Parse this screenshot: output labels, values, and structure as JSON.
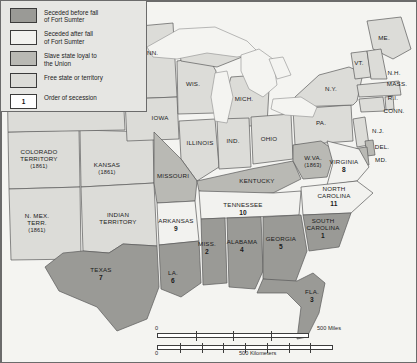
{
  "map": {
    "title": "Secession of the Southern States",
    "colors": {
      "seceded_before": "#9a9a96",
      "seceded_after": "#f2f2ef",
      "slave_loyal": "#b9b9b4",
      "free_state": "#dcdcd8",
      "water": "#f4f4f1",
      "border": "#5a5a5a",
      "background": "#e9e9e6"
    }
  },
  "legend": {
    "items": [
      {
        "label": "Seceded before fall\nof Fort Sumter",
        "line1": "Seceded before fall",
        "line2": "of Fort Sumter",
        "swatch": "#9a9a96"
      },
      {
        "label": "Seceded after fall\nof Fort Sumter",
        "line1": "Seceded after fall",
        "line2": "of Fort Sumter",
        "swatch": "#f2f2ef"
      },
      {
        "label": "Slave state loyal to\nthe Union",
        "line1": "Slave state loyal to",
        "line2": "the Union",
        "swatch": "#b9b9b4"
      },
      {
        "label": "Free state or territory",
        "line1": "Free state or territory",
        "line2": "",
        "swatch": "#dcdcd8"
      }
    ],
    "order_key": {
      "number": "1",
      "label": "Order of secession",
      "swatch": "#ffffff"
    }
  },
  "scale": {
    "miles_zero": "0",
    "miles_label": "500 Miles",
    "km_zero": "0",
    "km_label": "500 Kilometers"
  },
  "water_labels": [
    {
      "name": "ATLANTIC OCEAN",
      "x": 370,
      "y": 262
    },
    {
      "name": "GULF OF MEXICO",
      "x": 253,
      "y": 307
    }
  ],
  "lake_labels": [
    {
      "name": "Superior",
      "x": 182,
      "y": 36,
      "rot": -12
    },
    {
      "name": "L. Michigan",
      "x": 222,
      "y": 92,
      "rot": 72
    },
    {
      "name": "L. Huron",
      "x": 256,
      "y": 63,
      "rot": 38
    },
    {
      "name": "L. Erie",
      "x": 290,
      "y": 107,
      "rot": 28
    }
  ],
  "states": [
    {
      "name": "MINN.",
      "x": 148,
      "y": 52,
      "num": "",
      "year": "",
      "cat": "free"
    },
    {
      "name": "WIS.",
      "x": 192,
      "y": 83,
      "num": "",
      "year": "",
      "cat": "free"
    },
    {
      "name": "MICH.",
      "x": 243,
      "y": 98,
      "num": "",
      "year": "",
      "cat": "free"
    },
    {
      "name": "IOWA",
      "x": 159,
      "y": 117,
      "num": "",
      "year": "",
      "cat": "free"
    },
    {
      "name": "ILLINOIS",
      "x": 199,
      "y": 142,
      "num": "",
      "year": "",
      "cat": "free"
    },
    {
      "name": "IND.",
      "x": 232,
      "y": 140,
      "num": "",
      "year": "",
      "cat": "free"
    },
    {
      "name": "OHIO",
      "x": 268,
      "y": 138,
      "num": "",
      "year": "",
      "cat": "free"
    },
    {
      "name": "PA.",
      "x": 320,
      "y": 122,
      "num": "",
      "year": "",
      "cat": "free"
    },
    {
      "name": "N.Y.",
      "x": 330,
      "y": 88,
      "num": "",
      "year": "",
      "cat": "free"
    },
    {
      "name": "ME.",
      "x": 383,
      "y": 37,
      "num": "",
      "year": "",
      "cat": "free"
    },
    {
      "name": "VT.",
      "x": 358,
      "y": 62,
      "num": "",
      "year": "",
      "cat": "free"
    },
    {
      "name": "N.H.",
      "x": 393,
      "y": 72,
      "num": "",
      "year": "",
      "cat": "free"
    },
    {
      "name": "MASS.",
      "x": 396,
      "y": 83,
      "num": "",
      "year": "",
      "cat": "free"
    },
    {
      "name": "R.I.",
      "x": 392,
      "y": 97,
      "num": "",
      "year": "",
      "cat": "free"
    },
    {
      "name": "CONN.",
      "x": 393,
      "y": 110,
      "num": "",
      "year": "",
      "cat": "free"
    },
    {
      "name": "N.J.",
      "x": 377,
      "y": 130,
      "num": "",
      "year": "",
      "cat": "free"
    },
    {
      "name": "DEL.",
      "x": 381,
      "y": 146,
      "num": "",
      "year": "",
      "cat": "slave"
    },
    {
      "name": "MD.",
      "x": 380,
      "y": 159,
      "num": "",
      "year": "",
      "cat": "slave"
    },
    {
      "name": "COLORADO\nTERRITORY",
      "x": 38,
      "y": 158,
      "num": "",
      "year": "(1861)",
      "cat": "free"
    },
    {
      "name": "KANSAS",
      "x": 106,
      "y": 168,
      "num": "",
      "year": "(1861)",
      "cat": "free"
    },
    {
      "name": "MISSOURI",
      "x": 172,
      "y": 175,
      "num": "",
      "year": "",
      "cat": "slave"
    },
    {
      "name": "KENTUCKY",
      "x": 256,
      "y": 180,
      "num": "",
      "year": "",
      "cat": "slave"
    },
    {
      "name": "W.VA.",
      "x": 312,
      "y": 161,
      "num": "",
      "year": "(1863)",
      "cat": "slave"
    },
    {
      "name": "VIRGINIA",
      "x": 343,
      "y": 165,
      "num": "8",
      "year": "",
      "cat": "after"
    },
    {
      "name": "N. MEX.\nTERR.",
      "x": 36,
      "y": 222,
      "num": "",
      "year": "(1861)",
      "cat": "free"
    },
    {
      "name": "INDIAN\nTERRITORY",
      "x": 117,
      "y": 218,
      "num": "",
      "year": "",
      "cat": "free"
    },
    {
      "name": "ARKANSAS",
      "x": 175,
      "y": 224,
      "num": "9",
      "year": "",
      "cat": "after"
    },
    {
      "name": "TENNESSEE",
      "x": 242,
      "y": 208,
      "num": "10",
      "year": "",
      "cat": "after"
    },
    {
      "name": "NORTH\nCAROLINA",
      "x": 333,
      "y": 196,
      "num": "11",
      "year": "",
      "cat": "after"
    },
    {
      "name": "SOUTH\nCAROLINA",
      "x": 322,
      "y": 228,
      "num": "1",
      "year": "",
      "cat": "before"
    },
    {
      "name": "MISS.",
      "x": 206,
      "y": 247,
      "num": "2",
      "year": "",
      "cat": "before"
    },
    {
      "name": "ALABAMA",
      "x": 241,
      "y": 245,
      "num": "4",
      "year": "",
      "cat": "before"
    },
    {
      "name": "GEORGIA",
      "x": 280,
      "y": 242,
      "num": "5",
      "year": "",
      "cat": "before"
    },
    {
      "name": "LA.",
      "x": 172,
      "y": 276,
      "num": "6",
      "year": "",
      "cat": "before"
    },
    {
      "name": "TEXAS",
      "x": 100,
      "y": 273,
      "num": "7",
      "year": "",
      "cat": "before"
    },
    {
      "name": "FLA.",
      "x": 311,
      "y": 295,
      "num": "3",
      "year": "",
      "cat": "before"
    }
  ]
}
